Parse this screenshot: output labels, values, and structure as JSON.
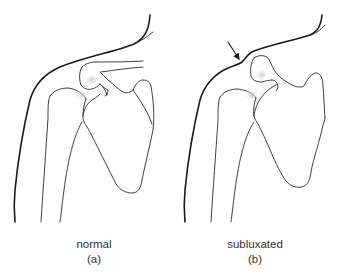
{
  "figure": {
    "panels": [
      {
        "id": "a",
        "caption": "normal",
        "tag": "(a)"
      },
      {
        "id": "b",
        "caption": "subluxated",
        "tag": "(b)",
        "annotation": "arrow-indicating-step-deformity"
      }
    ],
    "colors": {
      "background": "#ffffff",
      "line": "#1a1a1a",
      "shade": "#cccccc",
      "text": "#333333"
    }
  }
}
